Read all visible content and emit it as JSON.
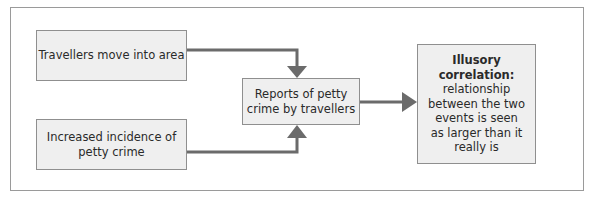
{
  "diagram": {
    "boxes": {
      "travellers": {
        "label": "Travellers move into area"
      },
      "crime": {
        "line1": "Increased incidence of",
        "line2": "petty crime"
      },
      "reports": {
        "line1": "Reports of petty",
        "line2": "crime by travellers"
      },
      "illusory": {
        "title_line1": "Illusory",
        "title_line2": "correlation:",
        "body_lines": [
          "relationship",
          "between the two",
          "events is seen",
          "as larger than it",
          "really is"
        ]
      }
    },
    "colors": {
      "box_fill": "#efefef",
      "box_border": "#8f8f8f",
      "arrow": "#6b6b6b",
      "frame_border": "#9a9a9a"
    }
  }
}
